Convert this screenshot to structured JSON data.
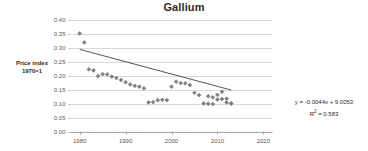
{
  "chart_data": {
    "type": "scatter",
    "title": "Gallium",
    "xlabel": "",
    "ylabel": "Price index 1970=1",
    "ylabel_lines": [
      "Price index",
      "1970=1"
    ],
    "xlim": [
      1978,
      2022
    ],
    "ylim": [
      0.0,
      0.4
    ],
    "x_ticks": [
      1980,
      1990,
      2000,
      2010,
      2020
    ],
    "x_tick_labels": [
      "1980",
      "1990",
      "2000",
      "2010",
      "2020"
    ],
    "y_ticks": [
      0.0,
      0.05,
      0.1,
      0.15,
      0.2,
      0.25,
      0.3,
      0.35,
      0.4
    ],
    "y_tick_labels": [
      "0.00",
      "0.05",
      "0.10",
      "0.15",
      "0.20",
      "0.25",
      "0.30",
      "0.35",
      "0.40"
    ],
    "grid": "horizontal",
    "legend": "none",
    "marker_color": "#808080",
    "trendline_color": "#3f3f3f",
    "gridline_color": "#d9d9d9",
    "series": [
      {
        "name": "Gallium price index",
        "x": [
          1980,
          1981,
          1982,
          1983,
          1984,
          1985,
          1986,
          1987,
          1988,
          1989,
          1990,
          1991,
          1992,
          1993,
          1994,
          1995,
          1996,
          1997,
          1998,
          1999,
          2000,
          2001,
          2002,
          2003,
          2004,
          2005,
          2006,
          2007,
          2008,
          2009,
          2010,
          2011,
          2012,
          2013
        ],
        "y": [
          0.35,
          0.318,
          0.222,
          0.218,
          0.198,
          0.205,
          0.204,
          0.196,
          0.191,
          0.184,
          0.176,
          0.168,
          0.163,
          0.16,
          0.154,
          0.104,
          0.105,
          0.112,
          0.113,
          0.112,
          0.16,
          0.178,
          0.173,
          0.172,
          0.166,
          0.138,
          0.13,
          0.1,
          0.126,
          0.122,
          0.114,
          0.116,
          0.117,
          0.1
        ]
      },
      {
        "name": "Gallium price index (continued)",
        "x": [
          2008,
          2009,
          2010,
          2011,
          2012,
          2013
        ],
        "y": [
          0.099,
          0.098,
          0.131,
          0.142,
          0.104,
          0.1
        ]
      }
    ],
    "trendline": {
      "equation": "y = -0.0044x + 9.0053",
      "r_squared_label": "R",
      "r_squared_sup": "2",
      "r_squared_value": "= 0.583",
      "r_squared_full": "R² = 0.583",
      "slope": -0.0044,
      "intercept": 9.0053,
      "x_start": 1980,
      "x_end": 2013,
      "y_start": 0.2933,
      "y_end": 0.1481
    }
  }
}
